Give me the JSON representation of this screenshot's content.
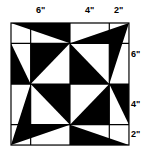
{
  "figure": {
    "colors": {
      "dark": "#000000",
      "light": "#ffffff",
      "line": "#000000"
    },
    "top_labels": [
      {
        "text": "6\"",
        "x": 36,
        "y": 6
      },
      {
        "text": "4\"",
        "x": 85,
        "y": 6
      },
      {
        "text": "2\"",
        "x": 114,
        "y": 6
      }
    ],
    "right_labels": [
      {
        "text": "6\"",
        "x": 131,
        "y": 50
      },
      {
        "text": "4\"",
        "x": 131,
        "y": 100
      },
      {
        "text": "2\"",
        "x": 131,
        "y": 130
      }
    ]
  }
}
